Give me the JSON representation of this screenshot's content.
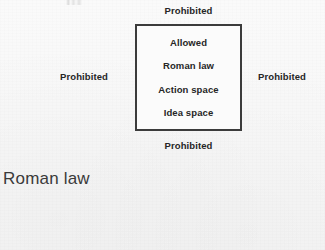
{
  "page": {
    "background_color": "#f7f7f7",
    "text_color": "#262626"
  },
  "diagram": {
    "type": "nested-region-diagram",
    "title": "",
    "box": {
      "border_color": "#3b3b3b",
      "fill_color": "#fbfbfb",
      "lines": [
        {
          "label": "Allowed"
        },
        {
          "label": "Roman law"
        },
        {
          "label": "Action space"
        },
        {
          "label": "Idea space"
        }
      ]
    },
    "outside_labels": [
      {
        "position": "top",
        "label": "Prohibited"
      },
      {
        "position": "left",
        "label": "Prohibited"
      },
      {
        "position": "right",
        "label": "Prohibited"
      },
      {
        "position": "bottom",
        "label": "Prohibited"
      }
    ]
  },
  "caption": {
    "text": "Roman law"
  }
}
